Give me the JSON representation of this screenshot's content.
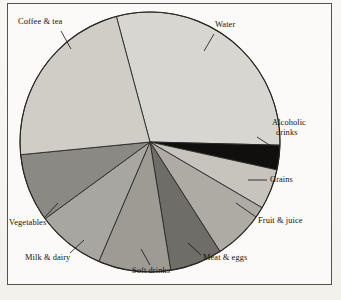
{
  "figure": {
    "kind": "pie-chart-figure",
    "background_color": "#f7f6f3",
    "frame_color": "#55534f",
    "plot_background": "#fbfaf8"
  },
  "chart_data": {
    "type": "pie",
    "title": "",
    "xlabel": "",
    "ylabel": "",
    "grid": false,
    "legend": "none",
    "labels_position": "outside-with-leader-lines",
    "start_angle_deg": -105,
    "direction": "clockwise",
    "center": {
      "x": 149,
      "y": 141
    },
    "radius": 130,
    "categories": [
      "Water",
      "Alcoholic drinks",
      "Grains",
      "Fruit & juice",
      "Meat & eggs",
      "Soft drinks",
      "Milk & dairy",
      "Vegetables",
      "Coffee & tea"
    ],
    "values": [
      29.0,
      3.0,
      5.0,
      7.5,
      6.5,
      9.0,
      8.5,
      8.5,
      23.0
    ],
    "unit": "percent",
    "slice_colors": [
      "#d8d6d0",
      "#100f0d",
      "#c6c4bd",
      "#adaba4",
      "#6f6d67",
      "#9d9b94",
      "#a8a6a0",
      "#8b8983",
      "#cfcdc6"
    ],
    "slice_edge_color": "#2a2825",
    "slices": [
      {
        "label": "Water",
        "value": 29.0,
        "color": "#d8d6d0",
        "start_deg": -105.0,
        "end_deg": 1.4
      },
      {
        "label": "Alcoholic drinks",
        "value": 3.0,
        "color": "#100f0d",
        "start_deg": 1.4,
        "end_deg": 12.4
      },
      {
        "label": "Grains",
        "value": 5.0,
        "color": "#c6c4bd",
        "start_deg": 12.4,
        "end_deg": 30.4
      },
      {
        "label": "Fruit & juice",
        "value": 7.5,
        "color": "#adaba4",
        "start_deg": 30.4,
        "end_deg": 57.4
      },
      {
        "label": "Meat & eggs",
        "value": 6.5,
        "color": "#6f6d67",
        "start_deg": 57.4,
        "end_deg": 80.8
      },
      {
        "label": "Soft drinks",
        "value": 9.0,
        "color": "#9d9b94",
        "start_deg": 80.8,
        "end_deg": 113.2
      },
      {
        "label": "Milk & dairy",
        "value": 8.5,
        "color": "#a8a6a0",
        "start_deg": 113.2,
        "end_deg": 143.8
      },
      {
        "label": "Vegetables",
        "value": 8.5,
        "color": "#8b8983",
        "start_deg": 143.8,
        "end_deg": 174.4
      },
      {
        "label": "Coffee & tea",
        "value": 23.0,
        "color": "#cfcdc6",
        "start_deg": 174.4,
        "end_deg": 255.0
      }
    ]
  },
  "labels": {
    "water": "Water",
    "coffee_tea": "Coffee & tea",
    "alcoholic_line1": "Alcoholic",
    "alcoholic_line2": "drinks",
    "grains": "Grains",
    "fruit_juice": "Fruit & juice",
    "meat_eggs": "Meat & eggs",
    "soft_drinks": "Soft drinks",
    "milk_dairy": "Milk & dairy",
    "vegetables": "Vegetables"
  }
}
